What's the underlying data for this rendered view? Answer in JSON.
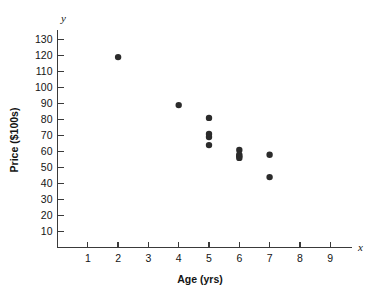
{
  "chart_data": {
    "type": "scatter",
    "title": "",
    "xlabel": "Age (yrs)",
    "ylabel": "Price ($100s)",
    "x_axis_variable": "x",
    "y_axis_variable": "y",
    "xlim": [
      0,
      10
    ],
    "ylim": [
      0,
      138
    ],
    "grid": false,
    "legend": null,
    "xticks": [
      1,
      2,
      3,
      4,
      5,
      6,
      7,
      8,
      9
    ],
    "xtick_labels": [
      "1",
      "2",
      "3",
      "4",
      "5",
      "6",
      "7",
      "8",
      "9"
    ],
    "yticks": [
      10,
      20,
      30,
      40,
      50,
      60,
      70,
      80,
      90,
      100,
      110,
      120,
      130
    ],
    "ytick_labels": [
      "10",
      "20",
      "30",
      "40",
      "50",
      "60",
      "70",
      "80",
      "90",
      "100",
      "110",
      "120",
      "130"
    ],
    "point_color": "#2b2b2b",
    "points": [
      {
        "x": 2,
        "y": 119
      },
      {
        "x": 4,
        "y": 89
      },
      {
        "x": 5,
        "y": 81
      },
      {
        "x": 5,
        "y": 71
      },
      {
        "x": 5,
        "y": 69
      },
      {
        "x": 5,
        "y": 64
      },
      {
        "x": 6,
        "y": 61
      },
      {
        "x": 6,
        "y": 58
      },
      {
        "x": 6,
        "y": 57
      },
      {
        "x": 6,
        "y": 56
      },
      {
        "x": 7,
        "y": 58
      },
      {
        "x": 7,
        "y": 44
      }
    ],
    "series": [
      {
        "name": "Price vs Age",
        "x": [
          2,
          4,
          5,
          5,
          5,
          5,
          6,
          6,
          6,
          6,
          7,
          7
        ],
        "values": [
          119,
          89,
          81,
          71,
          69,
          64,
          61,
          58,
          57,
          56,
          58,
          44
        ]
      }
    ]
  }
}
